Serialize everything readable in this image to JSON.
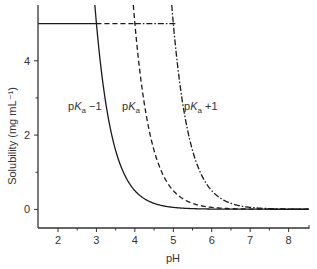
{
  "chart_data": {
    "type": "line",
    "title": "",
    "xlabel": "pH",
    "ylabel": "Solubility (mg mL⁻¹)",
    "xlim": [
      1.48,
      8.53
    ],
    "ylim": [
      -0.5,
      5.5
    ],
    "x_ticks": [
      2,
      3,
      4,
      5,
      6,
      7,
      8
    ],
    "x_minor_ticks": [
      2.5,
      3.5,
      4.5,
      5.5,
      6.5,
      7.5
    ],
    "y_ticks": [
      0,
      2,
      4
    ],
    "y_minor_ticks": [
      1,
      3
    ],
    "grid": false,
    "solubility_cap": 5,
    "intrinsic_solubility": 0.005,
    "series": [
      {
        "name": "pKa -1",
        "label_main": "pK",
        "label_sub": "a",
        "label_suffix": " −1",
        "style": "solid",
        "pKa": 6,
        "cap_end_x": 3.0,
        "x": [
          3.0,
          3.25,
          3.5,
          3.75,
          4.0,
          4.5,
          5.0,
          5.5,
          6.0,
          7.0
        ],
        "values": [
          5.0,
          2.82,
          1.59,
          0.89,
          0.5,
          0.16,
          0.055,
          0.021,
          0.01,
          0.0055
        ]
      },
      {
        "name": "pKa",
        "label_main": "pK",
        "label_sub": "a",
        "label_suffix": "",
        "style": "dashed",
        "pKa": 7,
        "cap_end_x": 4.0,
        "x": [
          4.0,
          4.25,
          4.5,
          4.75,
          5.0,
          5.5,
          6.0,
          6.5,
          7.0,
          8.0
        ],
        "values": [
          5.0,
          2.82,
          1.59,
          0.89,
          0.5,
          0.16,
          0.055,
          0.021,
          0.01,
          0.0055
        ]
      },
      {
        "name": "pKa +1",
        "label_main": "pK",
        "label_sub": "a",
        "label_suffix": " +1",
        "style": "dashdot",
        "pKa": 8,
        "cap_end_x": 5.0,
        "x": [
          5.0,
          5.25,
          5.5,
          5.75,
          6.0,
          6.5,
          7.0,
          7.5,
          8.0,
          8.5
        ],
        "values": [
          5.0,
          2.82,
          1.59,
          0.89,
          0.5,
          0.16,
          0.055,
          0.021,
          0.01,
          0.0055
        ]
      }
    ],
    "annotations": [
      {
        "series": 0,
        "x_px": 68,
        "y_px": 110
      },
      {
        "series": 1,
        "x_px": 122,
        "y_px": 110
      },
      {
        "series": 2,
        "x_px": 184,
        "y_px": 110
      }
    ]
  },
  "colors": {
    "axis": "#333333",
    "line": "#1a1a1a"
  }
}
